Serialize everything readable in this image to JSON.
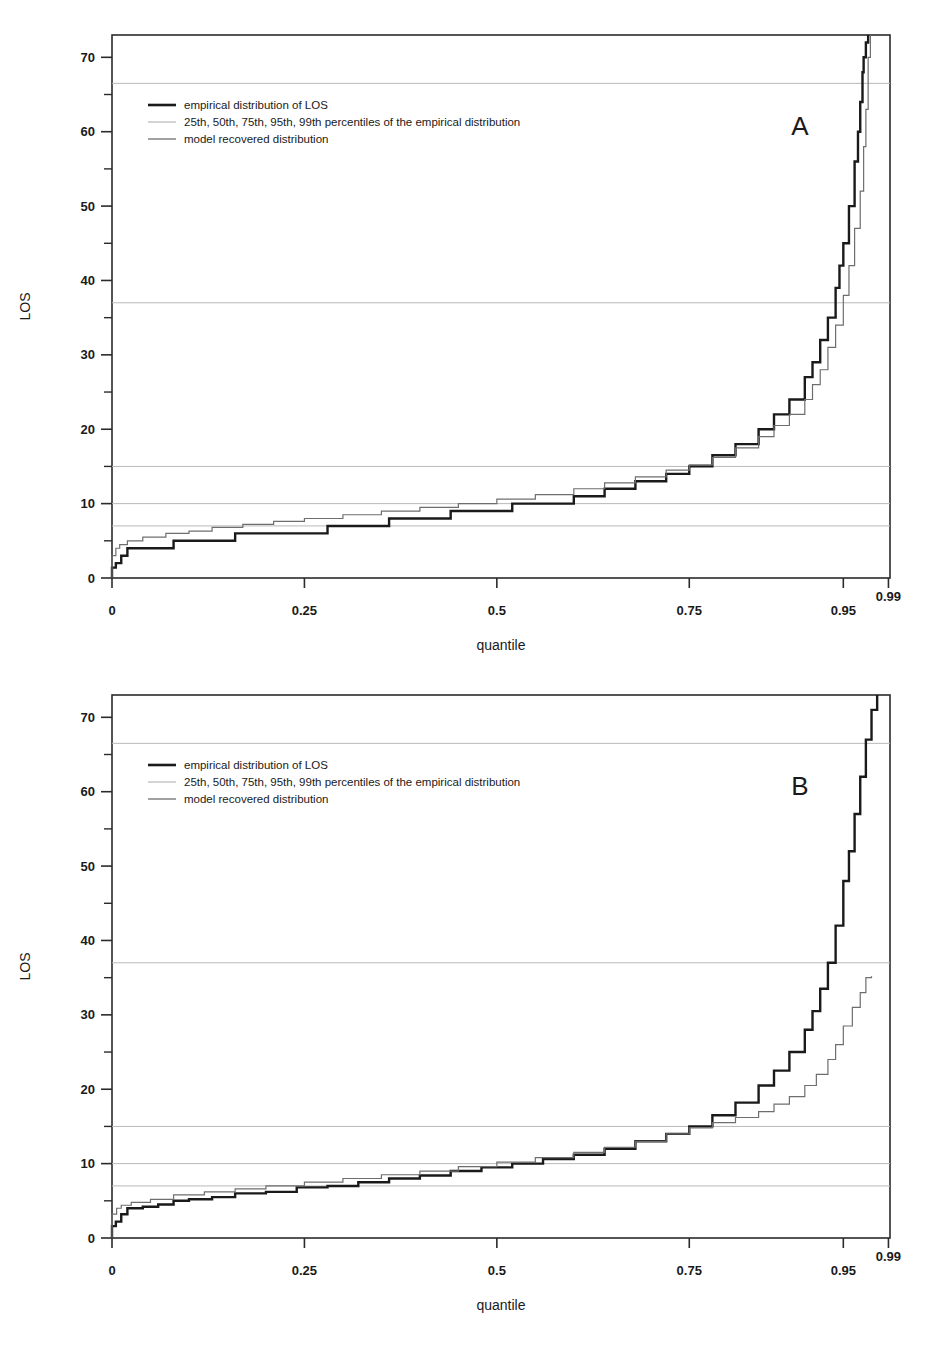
{
  "figure": {
    "panels": [
      {
        "id": "A",
        "letter": "A",
        "letter_x": 800,
        "letter_y": 135,
        "frame": {
          "x": 112,
          "y": 35,
          "width": 778,
          "height": 543
        },
        "axis": {
          "xlabel": "quantile",
          "ylabel": "LOS",
          "xticks": [
            {
              "value": 0,
              "label": "0",
              "px": 0.0
            },
            {
              "value": 0.25,
              "label": "0.25",
              "px": 0.25
            },
            {
              "value": 0.5,
              "label": "0.5",
              "px": 0.5
            },
            {
              "value": 0.75,
              "label": "0.75",
              "px": 0.75
            },
            {
              "value": 0.95,
              "label": "0.95",
              "px": 0.95
            },
            {
              "value": 0.99,
              "label": "0.99",
              "px": 0.99
            }
          ],
          "ytick_major": [
            0,
            10,
            20,
            30,
            40,
            50,
            60,
            70
          ],
          "ytick_minor": [
            5,
            15,
            25,
            35,
            45,
            55,
            65
          ],
          "xlim": [
            0,
            1.0
          ],
          "ylim": [
            0,
            73
          ]
        },
        "reference_lines": [
          {
            "percentile": "25th",
            "y": 7
          },
          {
            "percentile": "50th",
            "y": 10
          },
          {
            "percentile": "75th",
            "y": 15
          },
          {
            "percentile": "95th",
            "y": 37
          },
          {
            "percentile": "99th",
            "y": 66.5
          }
        ],
        "legend": {
          "x": 148,
          "y": 105,
          "items": [
            {
              "label": "empirical distribution of LOS",
              "color": "#1a1a1a",
              "width": 2.6
            },
            {
              "label": "25th, 50th, 75th, 95th, 99th percentiles of the empirical distribution",
              "color": "#a8a8a8",
              "width": 1.0
            },
            {
              "label": "model recovered distribution",
              "color": "#6e6e6e",
              "width": 1.3
            }
          ]
        }
      },
      {
        "id": "B",
        "letter": "B",
        "letter_x": 800,
        "letter_y": 135,
        "frame": {
          "x": 112,
          "y": 35,
          "width": 778,
          "height": 543
        },
        "axis": {
          "xlabel": "quantile",
          "ylabel": "LOS",
          "xticks": [
            {
              "value": 0,
              "label": "0",
              "px": 0.0
            },
            {
              "value": 0.25,
              "label": "0.25",
              "px": 0.25
            },
            {
              "value": 0.5,
              "label": "0.5",
              "px": 0.5
            },
            {
              "value": 0.75,
              "label": "0.75",
              "px": 0.75
            },
            {
              "value": 0.95,
              "label": "0.95",
              "px": 0.95
            },
            {
              "value": 0.99,
              "label": "0.99",
              "px": 0.99
            }
          ],
          "ytick_major": [
            0,
            10,
            20,
            30,
            40,
            50,
            60,
            70
          ],
          "ytick_minor": [
            5,
            15,
            25,
            35,
            45,
            55,
            65
          ],
          "xlim": [
            0,
            1.0
          ],
          "ylim": [
            0,
            73
          ]
        },
        "reference_lines": [
          {
            "percentile": "25th",
            "y": 7
          },
          {
            "percentile": "50th",
            "y": 10
          },
          {
            "percentile": "75th",
            "y": 15
          },
          {
            "percentile": "95th",
            "y": 37
          },
          {
            "percentile": "99th",
            "y": 66.5
          }
        ],
        "legend": {
          "x": 148,
          "y": 105,
          "items": [
            {
              "label": "empirical distribution of LOS",
              "color": "#1a1a1a",
              "width": 2.6
            },
            {
              "label": "25th, 50th, 75th, 95th, 99th percentiles of the empirical distribution",
              "color": "#a8a8a8",
              "width": 1.0
            },
            {
              "label": "model recovered distribution",
              "color": "#6e6e6e",
              "width": 1.3
            }
          ]
        }
      }
    ]
  },
  "chart_data": [
    {
      "type": "line",
      "panel": "A",
      "title": "",
      "xlabel": "quantile",
      "ylabel": "LOS",
      "xlim": [
        0,
        1.0
      ],
      "ylim": [
        0,
        73
      ],
      "grid": "horizontal reference lines at empirical percentiles only",
      "legend_position": "upper-left inside axes",
      "annotations": [
        "A"
      ],
      "reference_lines_y": [
        7,
        10,
        15,
        37,
        66.5
      ],
      "series": [
        {
          "name": "empirical distribution of LOS",
          "style": "step",
          "color": "#1a1a1a",
          "x": [
            0.0,
            0.005,
            0.012,
            0.02,
            0.04,
            0.06,
            0.08,
            0.1,
            0.13,
            0.16,
            0.2,
            0.24,
            0.28,
            0.32,
            0.36,
            0.4,
            0.44,
            0.48,
            0.52,
            0.56,
            0.6,
            0.64,
            0.68,
            0.72,
            0.75,
            0.78,
            0.81,
            0.84,
            0.86,
            0.88,
            0.9,
            0.91,
            0.92,
            0.93,
            0.94,
            0.945,
            0.95,
            0.955,
            0.96,
            0.963,
            0.965,
            0.967,
            0.968,
            0.97,
            0.972
          ],
          "y": [
            1.4,
            2.0,
            3.0,
            4.0,
            4.0,
            4.0,
            5.0,
            5.0,
            5.0,
            6.0,
            6.0,
            6.0,
            7.0,
            7.0,
            8.0,
            8.0,
            9.0,
            9.0,
            10.0,
            10.0,
            11.0,
            12.0,
            13.0,
            14.0,
            15.0,
            16.5,
            18.0,
            20.0,
            22.0,
            24.0,
            27.0,
            29.0,
            32.0,
            35.0,
            39.0,
            42.0,
            45.0,
            50.0,
            56.0,
            60.0,
            64.0,
            68.0,
            70.0,
            72.0,
            73.0
          ]
        },
        {
          "name": "model recovered distribution",
          "style": "step",
          "color": "#6e6e6e",
          "x": [
            0.0,
            0.005,
            0.01,
            0.02,
            0.04,
            0.07,
            0.1,
            0.13,
            0.17,
            0.21,
            0.25,
            0.3,
            0.35,
            0.4,
            0.45,
            0.5,
            0.55,
            0.6,
            0.64,
            0.68,
            0.72,
            0.75,
            0.78,
            0.81,
            0.84,
            0.86,
            0.88,
            0.9,
            0.91,
            0.92,
            0.93,
            0.94,
            0.95,
            0.955,
            0.96,
            0.965,
            0.968,
            0.97,
            0.972,
            0.974
          ],
          "y": [
            3.0,
            4.0,
            4.5,
            5.0,
            5.5,
            6.0,
            6.3,
            6.8,
            7.2,
            7.6,
            8.0,
            8.5,
            9.0,
            9.5,
            10.0,
            10.6,
            11.2,
            12.0,
            12.8,
            13.6,
            14.5,
            15.2,
            16.2,
            17.5,
            19.0,
            20.5,
            22.0,
            24.0,
            26.0,
            28.0,
            31.0,
            34.0,
            38.0,
            42.0,
            47.0,
            52.0,
            58.0,
            63.0,
            70.0,
            73.0
          ]
        }
      ]
    },
    {
      "type": "line",
      "panel": "B",
      "title": "",
      "xlabel": "quantile",
      "ylabel": "LOS",
      "xlim": [
        0,
        1.0
      ],
      "ylim": [
        0,
        73
      ],
      "grid": "horizontal reference lines at empirical percentiles only",
      "legend_position": "upper-left inside axes",
      "annotations": [
        "B"
      ],
      "reference_lines_y": [
        7,
        10,
        15,
        37,
        66.5
      ],
      "series": [
        {
          "name": "empirical distribution of LOS",
          "style": "step",
          "color": "#1a1a1a",
          "x": [
            0.0,
            0.005,
            0.012,
            0.02,
            0.04,
            0.06,
            0.08,
            0.1,
            0.13,
            0.16,
            0.2,
            0.24,
            0.28,
            0.32,
            0.36,
            0.4,
            0.44,
            0.48,
            0.52,
            0.56,
            0.6,
            0.64,
            0.68,
            0.72,
            0.75,
            0.78,
            0.81,
            0.84,
            0.86,
            0.88,
            0.9,
            0.91,
            0.92,
            0.93,
            0.94,
            0.95,
            0.955,
            0.96,
            0.965,
            0.97,
            0.975,
            0.98
          ],
          "y": [
            1.6,
            2.2,
            3.2,
            4.0,
            4.2,
            4.5,
            5.0,
            5.2,
            5.5,
            6.0,
            6.2,
            6.8,
            7.0,
            7.5,
            8.0,
            8.4,
            9.0,
            9.5,
            10.0,
            10.6,
            11.2,
            12.0,
            13.0,
            14.0,
            15.0,
            16.5,
            18.2,
            20.5,
            22.5,
            25.0,
            28.0,
            30.5,
            33.5,
            37.0,
            42.0,
            48.0,
            52.0,
            57.0,
            62.0,
            67.0,
            71.0,
            73.0
          ]
        },
        {
          "name": "model recovered distribution",
          "style": "step",
          "color": "#6e6e6e",
          "x": [
            0.0,
            0.006,
            0.012,
            0.025,
            0.05,
            0.08,
            0.12,
            0.16,
            0.2,
            0.25,
            0.3,
            0.35,
            0.4,
            0.45,
            0.5,
            0.55,
            0.6,
            0.64,
            0.68,
            0.72,
            0.75,
            0.78,
            0.81,
            0.84,
            0.86,
            0.88,
            0.9,
            0.915,
            0.93,
            0.94,
            0.95,
            0.958,
            0.965,
            0.97,
            0.975
          ],
          "y": [
            3.2,
            4.0,
            4.4,
            4.8,
            5.2,
            5.8,
            6.2,
            6.6,
            7.0,
            7.5,
            8.0,
            8.5,
            9.0,
            9.6,
            10.2,
            10.8,
            11.5,
            12.2,
            13.0,
            14.0,
            14.8,
            15.5,
            16.2,
            17.0,
            18.0,
            19.0,
            20.5,
            22.0,
            24.0,
            26.0,
            28.5,
            31.0,
            33.0,
            35.0,
            35.2
          ]
        }
      ]
    }
  ]
}
